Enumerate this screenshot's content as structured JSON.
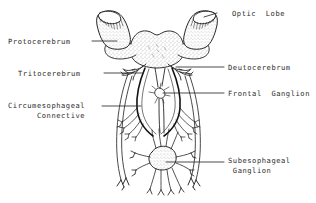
{
  "figure": {
    "type": "anatomical-line-drawing",
    "background_color": "#ffffff",
    "ink_color": "#1a1a1a",
    "text_color": "#2b2b2b",
    "stipple_color": "#555555"
  },
  "labels": [
    {
      "id": "optic-lobe",
      "text": "Optic  Lobe",
      "side": "right",
      "x": 232,
      "y": 9,
      "leader": {
        "x1": 217,
        "y1": 13,
        "x2": 204,
        "y2": 17
      }
    },
    {
      "id": "protocerebrum",
      "text": "Protocerebrum",
      "side": "left",
      "x": 8,
      "y": 37,
      "leader": {
        "x1": 92,
        "y1": 41,
        "x2": 117,
        "y2": 41
      }
    },
    {
      "id": "deutocerebrum",
      "text": "Deutocerebrum",
      "side": "right",
      "x": 228,
      "y": 63,
      "leader": {
        "x1": 224,
        "y1": 67,
        "x2": 176,
        "y2": 67
      }
    },
    {
      "id": "tritocerebrum",
      "text": "Tritocerebrum",
      "side": "left",
      "x": 18,
      "y": 69,
      "leader": {
        "x1": 104,
        "y1": 73,
        "x2": 143,
        "y2": 73
      }
    },
    {
      "id": "frontal-ganglion",
      "text": "Frontal  Ganglion",
      "side": "right",
      "x": 228,
      "y": 89,
      "leader": {
        "x1": 224,
        "y1": 93,
        "x2": 163,
        "y2": 93
      }
    },
    {
      "id": "circumesophageal-connective",
      "text": "Circumesophageal\n Connective",
      "side": "left",
      "x": 8,
      "y": 101,
      "leader": {
        "x1": 102,
        "y1": 106,
        "x2": 141,
        "y2": 106
      }
    },
    {
      "id": "subesophageal-ganglion",
      "text": "Subesophageal\n Ganglion",
      "side": "right",
      "x": 228,
      "y": 156,
      "leader": {
        "x1": 224,
        "y1": 162,
        "x2": 166,
        "y2": 162
      }
    }
  ],
  "anatomy_parts": [
    "optic-lobe-left",
    "optic-lobe-right",
    "protocerebrum",
    "deutocerebrum",
    "tritocerebrum",
    "frontal-ganglion",
    "circumesophageal-connective-left",
    "circumesophageal-connective-right",
    "subesophageal-ganglion",
    "nerve-branches"
  ]
}
